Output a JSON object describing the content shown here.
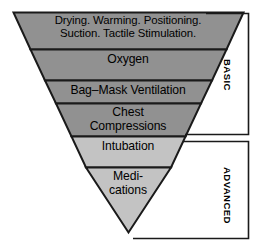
{
  "diagram": {
    "colors": {
      "band_basic": "#919191",
      "band_advanced": "#c3c3c3",
      "outline": "#1a1a1a",
      "text": "#000000",
      "background": "#ffffff"
    },
    "steps": [
      {
        "id": "drying-warming",
        "label": "Drying. Warming. Positioning.\nSuction. Tactile Stimulation.",
        "tier": "BASIC",
        "shade": "dark"
      },
      {
        "id": "oxygen",
        "label": "Oxygen",
        "tier": "BASIC",
        "shade": "dark"
      },
      {
        "id": "bag-mask-ventilation",
        "label": "Bag–Mask Ventilation",
        "tier": "BASIC",
        "shade": "dark"
      },
      {
        "id": "chest-compressions",
        "label": "Chest\nCompressions",
        "tier": "BASIC",
        "shade": "dark"
      },
      {
        "id": "intubation",
        "label": "Intubation",
        "tier": "ADVANCED",
        "shade": "light"
      },
      {
        "id": "medications",
        "label": "Medi-\ncations",
        "tier": "ADVANCED",
        "shade": "light"
      }
    ],
    "brackets": [
      {
        "id": "basic",
        "label": "BASIC",
        "covers": [
          "drying-warming",
          "oxygen",
          "bag-mask-ventilation",
          "chest-compressions"
        ]
      },
      {
        "id": "advanced",
        "label": "ADVANCED",
        "covers": [
          "intubation",
          "medications"
        ]
      }
    ]
  }
}
